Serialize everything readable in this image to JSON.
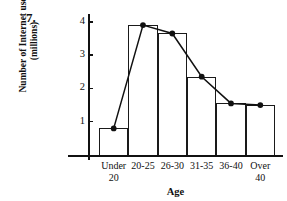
{
  "figure": {
    "number_label": "7.",
    "ylabel_line1": "Number of Internet users",
    "ylabel_line2": "(millions)",
    "xlabel": "Age"
  },
  "chart_data": {
    "type": "bar",
    "title": "",
    "xlabel": "Age",
    "ylabel": "Number of Internet users (millions)",
    "categories": [
      "Under 20",
      "20-25",
      "26-30",
      "31-35",
      "36-40",
      "Over 40"
    ],
    "category_lines": [
      [
        "Under",
        "20"
      ],
      [
        "20-25"
      ],
      [
        "26-30"
      ],
      [
        "31-35"
      ],
      [
        "36-40"
      ],
      [
        "Over",
        "40"
      ]
    ],
    "values": [
      0.8,
      3.9,
      3.65,
      2.35,
      1.55,
      1.5
    ],
    "ylim": [
      0,
      4.3
    ],
    "yticks": [
      1,
      2,
      3,
      4
    ],
    "ytick_labels": [
      "1",
      "2",
      "3",
      "4"
    ],
    "grid": false,
    "legend": false,
    "overlay": {
      "type": "line",
      "name": "frequency polygon",
      "markers": "filled-circle",
      "values": [
        0.8,
        3.9,
        3.65,
        2.35,
        1.55,
        1.5
      ]
    },
    "colors": {
      "bar_edge": "#1a1a1a",
      "bar_fill": "none",
      "line": "#111111",
      "axis": "#111111"
    }
  }
}
